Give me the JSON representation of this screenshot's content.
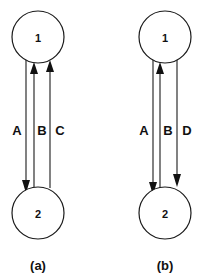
{
  "diagrams": [
    {
      "caption": "(a)",
      "nodes": [
        {
          "id": "1",
          "label": "1"
        },
        {
          "id": "2",
          "label": "2"
        }
      ],
      "edges": [
        {
          "label": "A",
          "from": "1",
          "to": "2",
          "direction": "down"
        },
        {
          "label": "B",
          "from": "2",
          "to": "1",
          "direction": "up"
        },
        {
          "label": "C",
          "from": "2",
          "to": "1",
          "direction": "up"
        }
      ]
    },
    {
      "caption": "(b)",
      "nodes": [
        {
          "id": "1",
          "label": "1"
        },
        {
          "id": "2",
          "label": "2"
        }
      ],
      "edges": [
        {
          "label": "A",
          "from": "1",
          "to": "2",
          "direction": "down"
        },
        {
          "label": "B",
          "from": "2",
          "to": "1",
          "direction": "up"
        },
        {
          "label": "D",
          "from": "1",
          "to": "2",
          "direction": "down"
        }
      ]
    }
  ],
  "colors": {
    "stroke": "#1a1a1a",
    "background": "#ffffff"
  }
}
